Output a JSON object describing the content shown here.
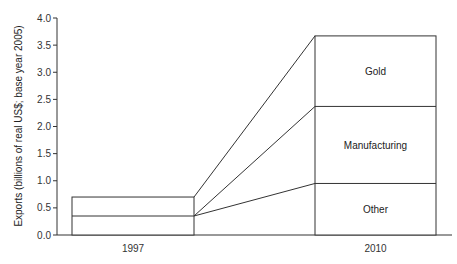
{
  "chart_data": {
    "type": "bar",
    "subtype": "stacked-bar-with-connectors",
    "title": "",
    "xlabel": "",
    "ylabel": "Exports (billions of real US$; base year 2005)",
    "ylim": [
      0,
      4.0
    ],
    "yticks": [
      "0.0",
      "0.5",
      "1.0",
      "1.5",
      "2.0",
      "2.5",
      "3.0",
      "3.5",
      "4.0"
    ],
    "categories": [
      "1997",
      "2010"
    ],
    "series": [
      {
        "name": "Other",
        "values": [
          0.35,
          0.95
        ]
      },
      {
        "name": "Manufacturing",
        "values": [
          0.0,
          1.42
        ]
      },
      {
        "name": "Gold",
        "values": [
          0.35,
          1.3
        ]
      }
    ],
    "totals": [
      0.7,
      3.67
    ],
    "segment_labels": [
      "Gold",
      "Manufacturing",
      "Other"
    ],
    "grid": false,
    "legend": "none (labels inside 2010 bar)"
  }
}
